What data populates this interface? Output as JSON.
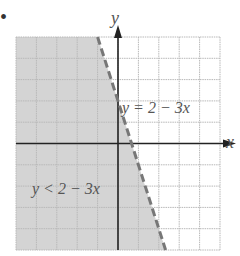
{
  "chart_data": {
    "type": "inequality-graph",
    "title": "",
    "xlabel": "x",
    "ylabel": "y",
    "xlim": [
      -5,
      5
    ],
    "ylim": [
      -5,
      5
    ],
    "grid": true,
    "boundary_line": {
      "equation": "y = 2 - 3x",
      "slope": -3,
      "intercept": 2,
      "style": "dashed"
    },
    "shaded_region": {
      "inequality": "y < 2 - 3x",
      "side": "below-left"
    },
    "annotations": [
      "y = 2 − 3x",
      "y < 2 − 3x"
    ]
  },
  "labels": {
    "marker": "•",
    "x_axis": "x",
    "y_axis": "y",
    "line_eq": "y = 2 − 3x",
    "region_eq": "y < 2 − 3x"
  },
  "colors": {
    "shade": "#d4d4d4",
    "grid": "#b8b8b8",
    "axis": "#222222",
    "dash": "#777777"
  }
}
